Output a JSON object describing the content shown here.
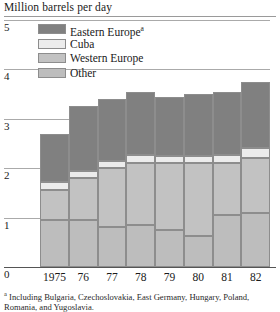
{
  "chart_data": {
    "type": "bar",
    "subtype": "stacked-column",
    "title": "Million barrels per day",
    "xlabel": "",
    "ylabel": "Million barrels per day",
    "ylim": [
      0,
      5
    ],
    "yticks": [
      0,
      1,
      2,
      3,
      4,
      5
    ],
    "ytick_labels": [
      "0",
      "1",
      "2",
      "3",
      "4",
      "5"
    ],
    "grid": true,
    "legend_position": "top-left-inside",
    "categories": [
      "1975",
      "76",
      "77",
      "78",
      "79",
      "80",
      "81",
      "82"
    ],
    "series": [
      {
        "name": "Other",
        "color": "#bdbdbd",
        "values": [
          0.95,
          0.95,
          0.8,
          0.85,
          0.75,
          0.62,
          1.05,
          1.1
        ]
      },
      {
        "name": "Western Europe",
        "color": "#c2c2c2",
        "values": [
          0.6,
          0.85,
          1.2,
          1.25,
          1.35,
          1.48,
          1.05,
          1.1
        ]
      },
      {
        "name": "Cuba",
        "color": "#ececec",
        "values": [
          0.18,
          0.15,
          0.15,
          0.17,
          0.15,
          0.15,
          0.17,
          0.2
        ]
      },
      {
        "name": "Eastern Europe",
        "color": "#808080",
        "values": [
          0.97,
          1.3,
          1.25,
          1.28,
          1.2,
          1.25,
          1.28,
          1.35
        ]
      }
    ],
    "totals": [
      2.7,
      3.25,
      3.4,
      3.55,
      3.45,
      3.5,
      3.55,
      3.75
    ]
  },
  "chart": {
    "title": "Million barrels per day",
    "y_axis": {
      "ticks": [
        "5",
        "4",
        "3",
        "2",
        "1",
        "0"
      ]
    },
    "x_axis": {
      "ticks": [
        "1975",
        "76",
        "77",
        "78",
        "79",
        "80",
        "81",
        "82"
      ]
    },
    "legend": [
      {
        "label": "Eastern Europe",
        "marker": "a",
        "swatch": "#808080"
      },
      {
        "label": "Cuba",
        "marker": "",
        "swatch": "#ececec"
      },
      {
        "label": "Western Europe",
        "marker": "",
        "swatch": "#c2c2c2"
      },
      {
        "label": "Other",
        "marker": "",
        "swatch": "#bdbdbd"
      }
    ],
    "footnote": {
      "marker": "a",
      "line1": "Including Bulgaria, Czechoslovakia, East Germany, Hungary,",
      "line2": "Poland, Romania, and Yugoslavia."
    }
  }
}
